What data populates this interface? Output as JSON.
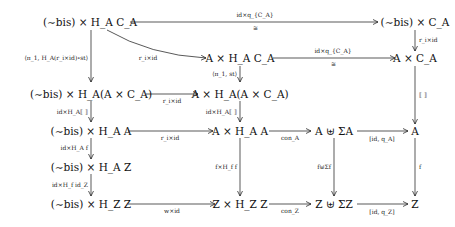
{
  "nodes": {
    "r0c0": "(∼bis) × H_A C_A",
    "r0c3": "(∼bis) × C_A",
    "r1c1": "A × H_A C_A",
    "r1c3": "A × C_A",
    "r2c0": "(∼bis) × H_A(A × C_A)",
    "r2c1": "A × H_A(A × C_A)",
    "r3c0": "(∼bis) × H_A A",
    "r3c1": "A × H_A A",
    "r3c2": "A ⊎ ΣA",
    "r3c3": "A",
    "r4c0": "(∼bis) × H_A Z",
    "r5c0": "(∼bis) × H_Z Z",
    "r5c1": "Z × H_Z Z",
    "r5c2": "Z ⊎ ΣZ",
    "r5c3": "Z"
  },
  "arrows": {
    "top_h": "id×q_{C_A}",
    "top_h_iso": "≅",
    "curved": "r_i×id",
    "r0c3_down": "r_i×id",
    "r1_h": "id×q_{C_A}",
    "r1_h_iso": "≅",
    "left_long": "⟨π_1, H_A(r_i×id)∘st⟩",
    "r1c1_down": "⟨π_1, st⟩",
    "r2_h": "r_i×id",
    "r1c3_down": "⟦ ⟧",
    "r2c0_down": "id×H_A⟦ ⟧",
    "r2c1_down": "id×H_A⟦ ⟧",
    "r3_h1": "r_i×id",
    "r3_h2": "con_A",
    "r3_h3": "[id, q_A]",
    "r3c0_down": "id×H_A f",
    "r4c0_down": "id×H_f id_Z",
    "r3c1_down": "f×H_f f",
    "r3c2_down": "f⊎Σf",
    "r3c3_down": "f",
    "r5_h1": "w×id",
    "r5_h2": "con_Z",
    "r5_h3": "[id, q_Z]"
  }
}
